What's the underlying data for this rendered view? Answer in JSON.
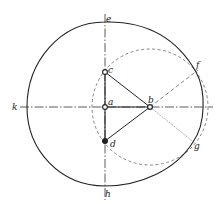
{
  "diagram": {
    "type": "geometric-construction",
    "colors": {
      "stroke": "#222222",
      "dashed": "#555555",
      "background": "#ffffff"
    },
    "labels": {
      "e": "e",
      "c": "c",
      "f": "f",
      "k": "k",
      "a": "a",
      "b": "b",
      "d": "d",
      "g": "g",
      "h": "h"
    },
    "points": {
      "c": [
        105,
        72
      ],
      "a": [
        105,
        107
      ],
      "b": [
        150,
        107
      ],
      "d": [
        105,
        141
      ],
      "f": [
        196,
        72
      ],
      "g": [
        193,
        142
      ]
    },
    "dashed_circle": {
      "center": "b",
      "radius": 58
    },
    "axes": {
      "vertical": {
        "from": "e",
        "to": "h",
        "style": "dash-dot"
      },
      "horizontal": {
        "from": "k",
        "style": "dash-dot"
      }
    }
  }
}
